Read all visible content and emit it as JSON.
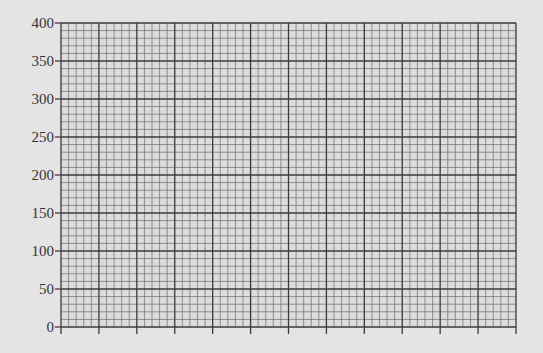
{
  "chart_data": {
    "type": "line",
    "title": "",
    "xlabel": "",
    "ylabel": "",
    "ylim": [
      0,
      400
    ],
    "y_ticks": [
      "0",
      "50",
      "100",
      "150",
      "200",
      "250",
      "300",
      "350",
      "400"
    ],
    "x_ticks": [
      "",
      "",
      "",
      "",
      "",
      "",
      "",
      "",
      "",
      "",
      "",
      "",
      ""
    ],
    "x_major_divisions": 12,
    "y_major_divisions": 8,
    "minor_per_major": 5,
    "grid": true,
    "series": [],
    "legend": null
  },
  "colors": {
    "background": "#e4e4e4",
    "plot_background": "#dcdcdc",
    "major_grid": "#3a3a3a",
    "minor_grid": "#6a6a6a",
    "text": "#333333"
  }
}
